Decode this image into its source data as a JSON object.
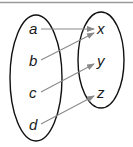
{
  "diagram": {
    "type": "mapping-diagram",
    "domain_set": {
      "elements": [
        {
          "label": "a",
          "x": 33,
          "y": 33
        },
        {
          "label": "b",
          "x": 33,
          "y": 66
        },
        {
          "label": "c",
          "x": 33,
          "y": 98
        },
        {
          "label": "d",
          "x": 33,
          "y": 130
        }
      ]
    },
    "codomain_set": {
      "elements": [
        {
          "label": "x",
          "x": 101,
          "y": 33
        },
        {
          "label": "y",
          "x": 101,
          "y": 66
        },
        {
          "label": "z",
          "x": 101,
          "y": 98
        }
      ]
    },
    "mappings": [
      {
        "from": "a",
        "to": "x"
      },
      {
        "from": "b",
        "to": "x"
      },
      {
        "from": "c",
        "to": "y"
      },
      {
        "from": "d",
        "to": "z"
      }
    ],
    "colors": {
      "ellipse_stroke": "#111111",
      "arrow": "#8a8a8a",
      "top_rule": "#9a9a9a"
    }
  }
}
